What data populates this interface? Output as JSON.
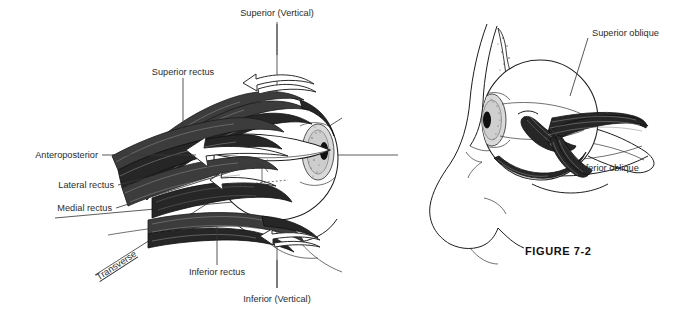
{
  "figure": {
    "caption": "FIGURE  7-2",
    "background_color": "#ffffff",
    "ink_color": "#1d1d1d",
    "muscle_color": "#3c3c3c",
    "label_color": "#2b2b2b"
  },
  "left_panel": {
    "name": "extraocular-rectus-muscles-axes-diagram",
    "labels": {
      "superior_vertical": "Superior (Vertical)",
      "superior_rectus": "Superior rectus",
      "anteroposterior": "Anteroposterior",
      "lateral_rectus": "Lateral rectus",
      "medial_rectus": "Medial rectus",
      "transverse": "Transverse",
      "inferior_rectus": "Inferior rectus",
      "inferior_vertical": "Inferior (Vertical)"
    },
    "axes": [
      {
        "id": "vertical-axis",
        "label": "Superior (Vertical) / Inferior (Vertical)",
        "orientation": "vertical"
      },
      {
        "id": "anteroposterior-axis",
        "label": "Anteroposterior",
        "orientation": "horizontal"
      },
      {
        "id": "transverse-axis",
        "label": "Transverse",
        "orientation": "oblique"
      }
    ],
    "muscles": [
      {
        "id": "superior-rectus",
        "label": "Superior rectus"
      },
      {
        "id": "lateral-rectus",
        "label": "Lateral rectus"
      },
      {
        "id": "medial-rectus",
        "label": "Medial rectus"
      },
      {
        "id": "inferior-rectus",
        "label": "Inferior rectus"
      }
    ],
    "rotation_arrows": [
      {
        "id": "superior-rotation-arrow"
      },
      {
        "id": "horizontal-rotation-arrow"
      },
      {
        "id": "inferior-rotation-arrow"
      },
      {
        "id": "transverse-rotation-arrow"
      }
    ]
  },
  "right_panel": {
    "name": "oblique-muscles-profile-diagram",
    "labels": {
      "superior_oblique": "Superior oblique",
      "inferior_oblique": "Inferior oblique"
    },
    "muscles": [
      {
        "id": "superior-oblique",
        "label": "Superior oblique"
      },
      {
        "id": "inferior-oblique",
        "label": "Inferior oblique"
      }
    ]
  }
}
